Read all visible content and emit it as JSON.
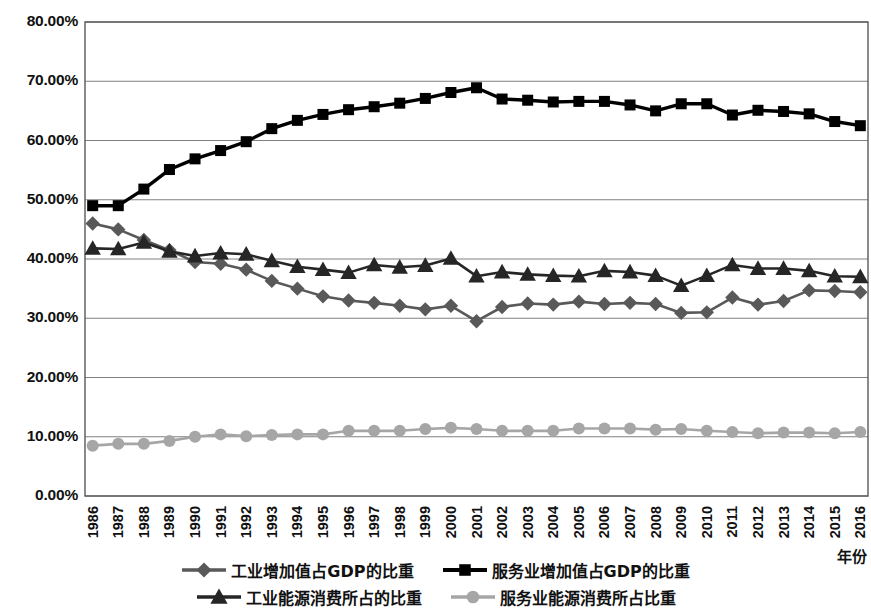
{
  "chart_data": {
    "type": "line",
    "title": "",
    "xlabel": "年份",
    "ylabel": "",
    "grid": true,
    "legend_position": "bottom",
    "ylim": [
      0,
      80
    ],
    "ytick_labels": [
      "80.00%",
      "70.00%",
      "60.00%",
      "50.00%",
      "40.00%",
      "30.00%",
      "20.00%",
      "10.00%",
      "0.00%"
    ],
    "ytick_values": [
      80,
      70,
      60,
      50,
      40,
      30,
      20,
      10,
      0
    ],
    "categories": [
      "1986",
      "1987",
      "1988",
      "1989",
      "1990",
      "1991",
      "1992",
      "1993",
      "1994",
      "1995",
      "1996",
      "1997",
      "1998",
      "1999",
      "2000",
      "2001",
      "2002",
      "2003",
      "2004",
      "2005",
      "2006",
      "2007",
      "2008",
      "2009",
      "2010",
      "2011",
      "2012",
      "2013",
      "2014",
      "2015",
      "2016"
    ],
    "series": [
      {
        "name": "工业增加值占GDP的比重",
        "marker": "diamond",
        "color": "#595959",
        "values": [
          46.0,
          45.0,
          43.2,
          41.5,
          39.5,
          39.2,
          38.2,
          36.3,
          35.0,
          33.7,
          33.0,
          32.6,
          32.1,
          31.5,
          32.1,
          29.5,
          31.9,
          32.5,
          32.3,
          32.8,
          32.4,
          32.6,
          32.4,
          30.9,
          31.0,
          33.5,
          32.3,
          32.9,
          34.7,
          34.6,
          34.4
        ]
      },
      {
        "name": "服务业增加值占GDP的比重",
        "marker": "square",
        "color": "#000000",
        "values": [
          49.0,
          49.0,
          51.8,
          55.1,
          56.9,
          58.3,
          59.8,
          62.0,
          63.4,
          64.4,
          65.2,
          65.7,
          66.3,
          67.1,
          68.1,
          68.9,
          67.0,
          66.8,
          66.5,
          66.6,
          66.6,
          66.0,
          65.0,
          66.2,
          66.2,
          64.3,
          65.1,
          64.9,
          64.5,
          63.2,
          62.5
        ]
      },
      {
        "name": "工业能源消费所占的比重",
        "marker": "triangle",
        "color": "#262626",
        "values": [
          41.8,
          41.7,
          42.8,
          41.3,
          40.5,
          41.0,
          40.8,
          39.7,
          38.7,
          38.2,
          37.7,
          39.0,
          38.6,
          38.9,
          40.1,
          37.1,
          37.8,
          37.4,
          37.2,
          37.1,
          38.0,
          37.8,
          37.2,
          35.5,
          37.2,
          39.0,
          38.4,
          38.4,
          38.0,
          37.1,
          37.0
        ]
      },
      {
        "name": "服务业能源消费所占比重",
        "marker": "circle",
        "color": "#a6a6a6",
        "values": [
          8.5,
          8.8,
          8.8,
          9.3,
          10.0,
          10.4,
          10.1,
          10.3,
          10.4,
          10.4,
          11.0,
          11.0,
          11.0,
          11.3,
          11.5,
          11.3,
          11.0,
          11.0,
          11.0,
          11.4,
          11.4,
          11.4,
          11.2,
          11.3,
          11.0,
          10.8,
          10.6,
          10.7,
          10.7,
          10.6,
          10.8
        ]
      }
    ]
  },
  "axis": {
    "x_title": "年份"
  },
  "legend": {
    "rows": [
      [
        {
          "label": "工业增加值占GDP的比重",
          "marker": "diamond",
          "color": "#595959"
        },
        {
          "label": "服务业增加值占GDP的比重",
          "marker": "square",
          "color": "#000000"
        }
      ],
      [
        {
          "label": "工业能源消费所占的比重",
          "marker": "triangle",
          "color": "#262626"
        },
        {
          "label": "服务业能源消费所占比重",
          "marker": "circle",
          "color": "#a6a6a6"
        }
      ]
    ]
  }
}
